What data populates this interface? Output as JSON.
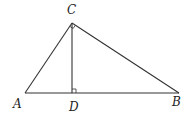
{
  "diagram": {
    "type": "geometry",
    "points": {
      "A": {
        "label": "A",
        "x": 25,
        "y": 93,
        "lx": 13,
        "ly": 108
      },
      "B": {
        "label": "B",
        "x": 179,
        "y": 93,
        "lx": 172,
        "ly": 106
      },
      "C": {
        "label": "C",
        "x": 72,
        "y": 23,
        "lx": 67,
        "ly": 14
      },
      "D": {
        "label": "D",
        "x": 72,
        "y": 93,
        "lx": 69,
        "ly": 111
      }
    },
    "segments": [
      {
        "name": "AB",
        "from": "A",
        "to": "B"
      },
      {
        "name": "AC",
        "from": "A",
        "to": "C"
      },
      {
        "name": "BC",
        "from": "B",
        "to": "C"
      },
      {
        "name": "CD",
        "from": "C",
        "to": "D"
      }
    ],
    "right_angles": [
      "ACB",
      "CDB"
    ]
  }
}
